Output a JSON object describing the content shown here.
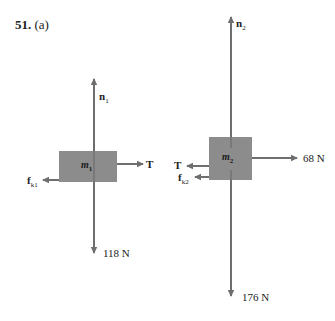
{
  "problem": {
    "number": "51.",
    "part": "(a)"
  },
  "colors": {
    "block": "#8c8c8c",
    "arrow": "#6e6e6e",
    "text": "#222222"
  },
  "diagram_1": {
    "mass_label": "m",
    "mass_sub": "1",
    "forces": {
      "normal": {
        "symbol": "n",
        "sub": "1",
        "direction": "up"
      },
      "tension": {
        "symbol": "T",
        "direction": "right"
      },
      "friction": {
        "symbol": "f",
        "sub": "k1",
        "direction": "left"
      },
      "weight": {
        "value": "118 N",
        "direction": "down"
      }
    }
  },
  "diagram_2": {
    "mass_label": "m",
    "mass_sub": "2",
    "forces": {
      "normal": {
        "symbol": "n",
        "sub": "2",
        "direction": "up"
      },
      "tension": {
        "symbol": "T",
        "direction": "left"
      },
      "friction": {
        "symbol": "f",
        "sub": "k2",
        "direction": "left"
      },
      "applied": {
        "value": "68 N",
        "direction": "right"
      },
      "weight": {
        "value": "176 N",
        "direction": "down"
      }
    }
  }
}
